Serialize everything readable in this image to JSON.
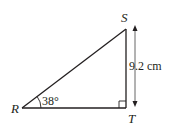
{
  "diagram": {
    "type": "right-triangle",
    "vertices": {
      "R": {
        "label": "R"
      },
      "S": {
        "label": "S"
      },
      "T": {
        "label": "T"
      }
    },
    "angle_R": {
      "label": "38°",
      "value": 38
    },
    "side_ST": {
      "label": "9.2 cm",
      "value": 9.2,
      "unit": "cm"
    },
    "right_angle_at": "T",
    "colors": {
      "stroke": "#231f20",
      "arrow": "#555555"
    }
  }
}
